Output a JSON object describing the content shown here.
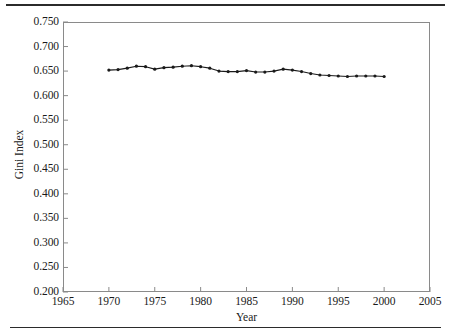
{
  "figure": {
    "has_top_rule": true,
    "has_bottom_rule": true,
    "frame_color": "#8a8a8a",
    "line_color": "#1a1a1a",
    "marker_color": "#1a1a1a",
    "background": "#ffffff"
  },
  "chart_data": {
    "type": "line",
    "title": "",
    "xlabel": "Year",
    "ylabel": "Gini Index",
    "xlim": [
      1965,
      2005
    ],
    "ylim": [
      0.2,
      0.75
    ],
    "grid": false,
    "legend": null,
    "xticks": [
      1965,
      1970,
      1975,
      1980,
      1985,
      1990,
      1995,
      2000,
      2005
    ],
    "xtick_labels": [
      "1965",
      "1970",
      "1975",
      "1980",
      "1985",
      "1990",
      "1995",
      "2000",
      "2005"
    ],
    "yticks": [
      0.2,
      0.25,
      0.3,
      0.35,
      0.4,
      0.45,
      0.5,
      0.55,
      0.6,
      0.65,
      0.7,
      0.75
    ],
    "ytick_labels": [
      "0.200",
      "0.250",
      "0.300",
      "0.350",
      "0.400",
      "0.450",
      "0.500",
      "0.550",
      "0.600",
      "0.650",
      "0.700",
      "0.750"
    ],
    "marker": "dot",
    "x": [
      1970,
      1971,
      1972,
      1973,
      1974,
      1975,
      1976,
      1977,
      1978,
      1979,
      1980,
      1981,
      1982,
      1983,
      1984,
      1985,
      1986,
      1987,
      1988,
      1989,
      1990,
      1991,
      1992,
      1993,
      1994,
      1995,
      1996,
      1997,
      1998,
      1999,
      2000
    ],
    "values": [
      0.652,
      0.653,
      0.656,
      0.66,
      0.659,
      0.654,
      0.657,
      0.658,
      0.66,
      0.661,
      0.659,
      0.656,
      0.65,
      0.649,
      0.649,
      0.651,
      0.648,
      0.648,
      0.65,
      0.654,
      0.652,
      0.649,
      0.645,
      0.642,
      0.641,
      0.64,
      0.639,
      0.64,
      0.64,
      0.64,
      0.639
    ]
  }
}
